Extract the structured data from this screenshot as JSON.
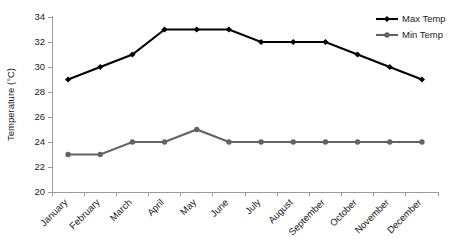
{
  "chart_data": {
    "type": "line",
    "title": "",
    "subtitle": "",
    "xlabel": "",
    "ylabel": "Temperature (°C)",
    "categories": [
      "January",
      "February",
      "March",
      "April",
      "May",
      "June",
      "July",
      "August",
      "September",
      "October",
      "November",
      "December"
    ],
    "series": [
      {
        "name": "Max Temp",
        "color": "#000000",
        "marker": "diamond",
        "values": [
          29,
          30,
          31,
          33,
          33,
          33,
          32,
          32,
          32,
          31,
          30,
          29
        ]
      },
      {
        "name": "Min Temp",
        "color": "#636363",
        "marker": "circle",
        "values": [
          23,
          23,
          24,
          24,
          25,
          24,
          24,
          24,
          24,
          24,
          24,
          24
        ]
      }
    ],
    "ylim": [
      20,
      34
    ],
    "yticks": [
      20,
      22,
      24,
      26,
      28,
      30,
      32,
      34
    ],
    "ytick_labels": [
      "20",
      "22",
      "24",
      "26",
      "28",
      "30",
      "32",
      "34"
    ],
    "grid": false,
    "legend_position": "top-right",
    "xtick_label_rotation": -45,
    "background": "#ffffff",
    "axis_color": "#9a9a9a"
  },
  "legend": {
    "entries": [
      {
        "label": "Max Temp"
      },
      {
        "label": "Min Temp"
      }
    ]
  }
}
